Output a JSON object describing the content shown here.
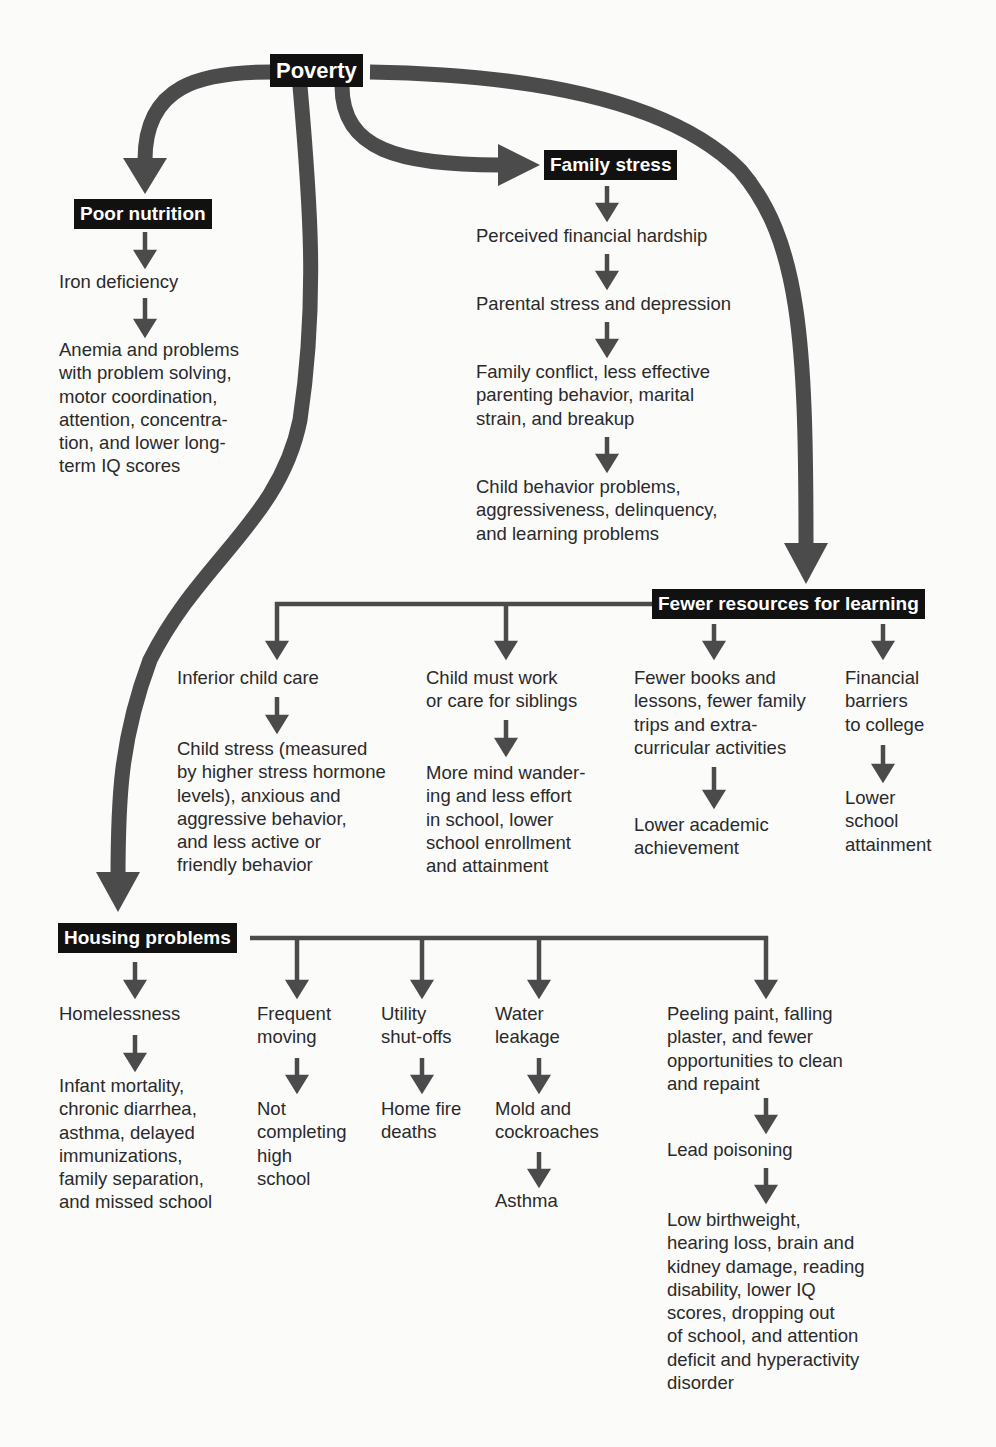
{
  "root": {
    "label": "Poverty"
  },
  "poor_nutrition": {
    "label": "Poor nutrition",
    "steps": [
      "Iron deficiency",
      "Anemia and problems\nwith problem solving,\nmotor coordination,\nattention, concentra-\ntion, and lower long-\nterm IQ scores"
    ]
  },
  "family_stress": {
    "label": "Family stress",
    "steps": [
      "Perceived financial hardship",
      "Parental stress and depression",
      "Family conflict, less effective\nparenting behavior, marital\nstrain, and breakup",
      "Child behavior problems,\naggressiveness, delinquency,\nand learning problems"
    ]
  },
  "fewer_resources": {
    "label": "Fewer resources for learning",
    "branches": [
      {
        "cause": "Inferior child care",
        "effect": "Child stress (measured\nby higher stress hormone\nlevels), anxious and\naggressive behavior,\nand less active or\nfriendly behavior"
      },
      {
        "cause": "Child must work\nor care for siblings",
        "effect": "More mind wander-\ning and less effort\nin school, lower\nschool enrollment\nand attainment"
      },
      {
        "cause": "Fewer books and\nlessons, fewer family\ntrips and extra-\ncurricular activities",
        "effect": "Lower academic\nachievement"
      },
      {
        "cause": "Financial\nbarriers\nto college",
        "effect": "Lower\nschool\nattainment"
      }
    ]
  },
  "housing": {
    "label": "Housing problems",
    "branches": [
      {
        "steps": [
          "Homelessness",
          "Infant mortality,\nchronic diarrhea,\nasthma, delayed\nimmunizations,\nfamily separation,\nand missed school"
        ]
      },
      {
        "steps": [
          "Frequent\nmoving",
          "Not\ncompleting\nhigh\nschool"
        ]
      },
      {
        "steps": [
          "Utility\nshut-offs",
          "Home fire\ndeaths"
        ]
      },
      {
        "steps": [
          "Water\nleakage",
          "Mold and\ncockroaches",
          "Asthma"
        ]
      },
      {
        "steps": [
          "Peeling paint, falling\nplaster, and fewer\nopportunities to clean\nand repaint",
          "Lead poisoning",
          "Low birthweight,\nhearing loss, brain and\nkidney damage, reading\ndisability, lower IQ\nscores, dropping out\nof school, and attention\ndeficit and hyperactivity\ndisorder"
        ]
      }
    ]
  },
  "colors": {
    "arrow": "#4a4a4a",
    "label_bg": "#111111",
    "label_text": "#ffffff",
    "background": "#fbfbfa"
  }
}
